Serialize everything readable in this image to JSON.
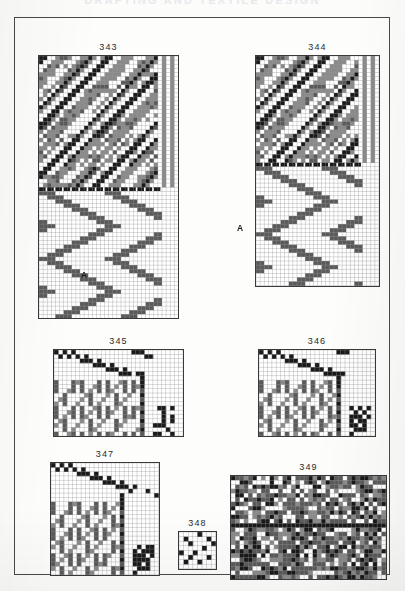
{
  "page": {
    "running_head": "DRAFTING AND TEXTILE DESIGN",
    "frame_color": "#4a4a4a",
    "paper_color": "#fdfdfc",
    "ink_color": "#2b2b2b"
  },
  "colors": {
    "black": "#1a1a1a",
    "gray": "#8a8a8a",
    "dark_gray": "#5a5a5a",
    "white": "#ffffff",
    "grid_line": "#9a9a9a"
  },
  "figures": [
    {
      "id": "fig-343",
      "caption": "343",
      "a_label": "A",
      "a_label_pos": {
        "left": 66,
        "top": 252
      },
      "pos": {
        "left": 23,
        "top": 37
      },
      "cell": 4.1,
      "cols": 34,
      "rows": 64,
      "divider_row": 32,
      "sections": [
        {
          "name": "cloth-diagram",
          "rows": [
            0,
            31
          ],
          "kind": "shaded-twill-block"
        },
        {
          "name": "weave-plan",
          "rows": [
            33,
            63
          ],
          "kind": "zigzag-twill"
        }
      ]
    },
    {
      "id": "fig-344",
      "caption": "344",
      "a_label": "A",
      "a_label_pos": {
        "left": 222,
        "top": 205
      },
      "pos": {
        "left": 240,
        "top": 37
      },
      "cell": 4.1,
      "cols": 30,
      "rows": 56,
      "divider_row": 26,
      "sections": [
        {
          "name": "cloth-diagram",
          "rows": [
            0,
            25
          ],
          "kind": "shaded-twill-block"
        },
        {
          "name": "weave-plan",
          "rows": [
            27,
            55
          ],
          "kind": "zigzag-twill"
        }
      ]
    },
    {
      "id": "fig-345",
      "caption": "345",
      "pos": {
        "left": 38,
        "top": 331
      },
      "cell": 4.3,
      "cols": 30,
      "rows": 20,
      "kind": "draft",
      "threading_rows": 6,
      "tieup_cols": 9,
      "shafts": 6
    },
    {
      "id": "fig-346",
      "caption": "346",
      "pos": {
        "left": 243,
        "top": 331
      },
      "cell": 4.3,
      "cols": 27,
      "rows": 20,
      "kind": "draft",
      "threading_rows": 6,
      "tieup_cols": 8,
      "shafts": 6
    },
    {
      "id": "fig-347",
      "caption": "347",
      "pos": {
        "left": 35,
        "top": 444
      },
      "cell": 4.3,
      "cols": 25,
      "rows": 26,
      "kind": "draft",
      "threading_rows": 8,
      "tieup_cols": 8,
      "shafts": 8
    },
    {
      "id": "fig-348",
      "caption": "348",
      "pos": {
        "left": 163,
        "top": 513
      },
      "cell": 4.6,
      "cols": 8,
      "rows": 8,
      "kind": "tieup-small"
    },
    {
      "id": "fig-349",
      "caption": "349",
      "pos": {
        "left": 215,
        "top": 457
      },
      "cell": 4.3,
      "cols": 36,
      "rows": 24,
      "divider_row": 11,
      "kind": "cloth-pattern"
    }
  ]
}
